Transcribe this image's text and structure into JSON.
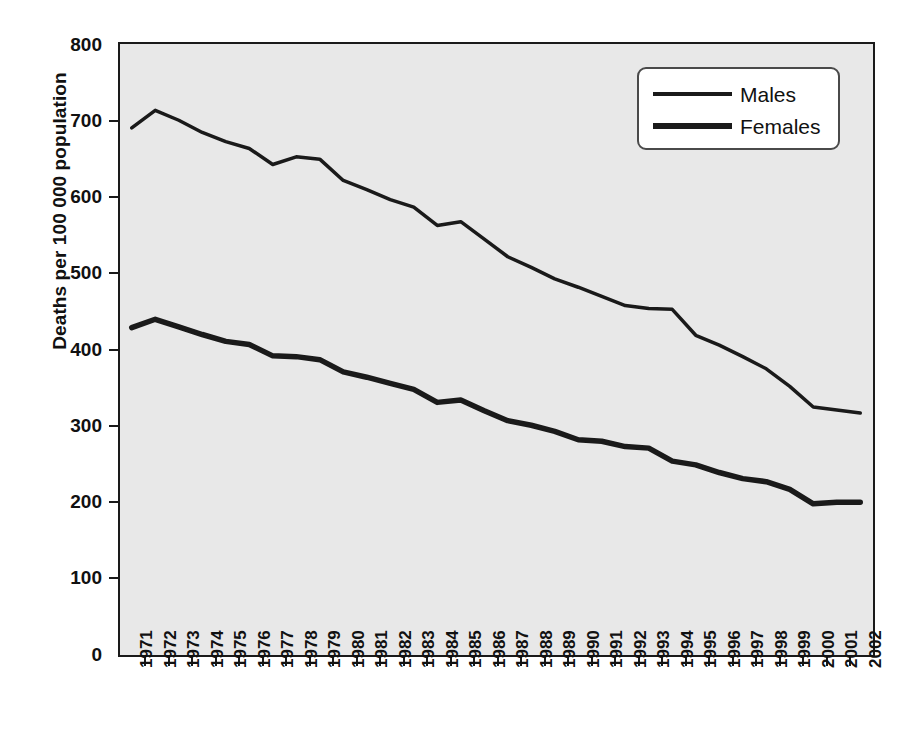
{
  "chart_data": {
    "type": "line",
    "title": "",
    "subtitle": "",
    "xlabel": "",
    "ylabel": "Deaths per 100 000 population",
    "ylim": [
      0,
      800
    ],
    "yticks": [
      0,
      100,
      200,
      300,
      400,
      500,
      600,
      700,
      800
    ],
    "grid": false,
    "legend_position": "top-right",
    "legend_entries": [
      "Males",
      "Females"
    ],
    "categories": [
      "1971",
      "1972",
      "1973",
      "1974",
      "1975",
      "1976",
      "1977",
      "1978",
      "1979",
      "1980",
      "1981",
      "1982",
      "1983",
      "1984",
      "1985",
      "1986",
      "1987",
      "1988",
      "1989",
      "1990",
      "1991",
      "1992",
      "1993",
      "1994",
      "1995",
      "1996",
      "1997",
      "1998",
      "1999",
      "2000",
      "2001",
      "2002"
    ],
    "series": [
      {
        "name": "Males",
        "line_width": 3.5,
        "color": "#1a1a1a",
        "values": [
          690,
          713,
          700,
          684,
          672,
          663,
          642,
          652,
          649,
          621,
          609,
          596,
          586,
          562,
          567,
          544,
          521,
          507,
          492,
          481,
          469,
          457,
          453,
          452,
          418,
          405,
          390,
          374,
          351,
          324,
          320,
          316
        ]
      },
      {
        "name": "Females",
        "line_width": 5.5,
        "color": "#1a1a1a",
        "values": [
          428,
          439,
          429,
          419,
          410,
          406,
          391,
          390,
          386,
          370,
          363,
          355,
          347,
          330,
          333,
          319,
          306,
          300,
          292,
          281,
          279,
          272,
          270,
          253,
          248,
          238,
          230,
          226,
          216,
          197,
          199,
          199
        ]
      }
    ],
    "colors": {
      "plot_background": "#e8e8e8",
      "axis": "#1a1a1a",
      "line": "#1a1a1a",
      "legend_background": "#ffffff",
      "legend_border": "#4a4a4a",
      "page_background": "#ffffff"
    }
  }
}
